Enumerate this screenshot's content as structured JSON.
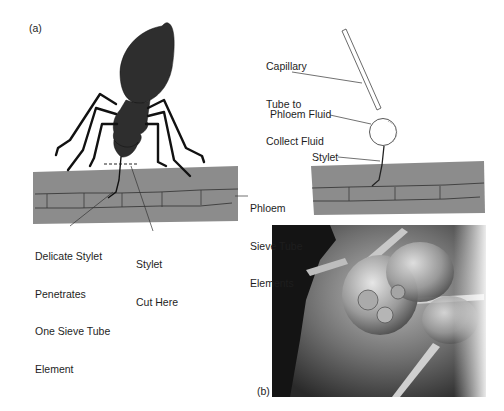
{
  "panel_a": {
    "label": "(a)",
    "annotations": {
      "delicate_stylet": [
        "Delicate Stylet",
        "Penetrates",
        "One Sieve Tube",
        "Element"
      ],
      "stylet_cut": [
        "Stylet",
        "Cut Here"
      ],
      "phloem_sieve": [
        "Phloem",
        "Sieve Tube",
        "Elements"
      ]
    }
  },
  "panel_a_right": {
    "annotations": {
      "capillary": [
        "Capillary",
        "Tube to",
        "Collect Fluid"
      ],
      "phloem_fluid": "Phloem Fluid",
      "stylet": "Stylet"
    }
  },
  "panel_b": {
    "label": "(b)",
    "description": "Scanning electron micrograph of aphid mouthparts with stylet"
  },
  "colors": {
    "phloem_tissue": "#8c8c8c",
    "insect": "#2e2e2e",
    "line": "#333333"
  }
}
